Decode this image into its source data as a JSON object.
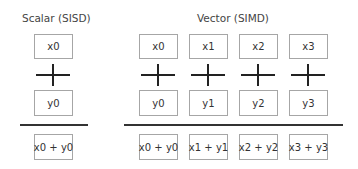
{
  "scalar": {
    "title": "Scalar (SISD)",
    "x_operand": "x0",
    "operator": "plus",
    "y_operand": "y0",
    "result": "x0 + y0"
  },
  "vector": {
    "title": "Vector (SIMD)",
    "lanes": [
      {
        "x": "x0",
        "y": "y0",
        "result": "x0 + y0"
      },
      {
        "x": "x1",
        "y": "y1",
        "result": "x1 + y1"
      },
      {
        "x": "x2",
        "y": "y2",
        "result": "x2 + y2"
      },
      {
        "x": "x3",
        "y": "y3",
        "result": "x3 + y3"
      }
    ]
  },
  "colors": {
    "box_border": "#a6a6a6",
    "rule": "#333333",
    "text": "#333333"
  }
}
